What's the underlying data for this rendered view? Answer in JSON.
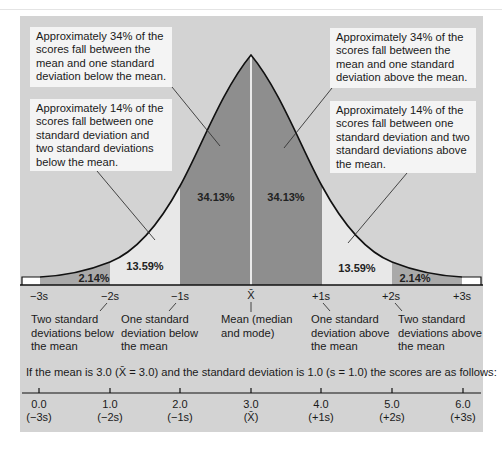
{
  "notes": {
    "left_34": "Approximately 34% of the scores fall between the mean and one standard deviation below the mean.",
    "right_34": "Approximately 34% of the scores fall between the mean and one standard deviation above the mean.",
    "left_14": "Approximately 14% of the scores fall between one standard deviation and two standard deviations below the mean.",
    "right_14": "Approximately 14% of the scores fall between one standard deviation and two standard deviations above the mean."
  },
  "regions": {
    "left_2": "2.14%",
    "left_14": "13.59%",
    "left_34": "34.13%",
    "right_34": "34.13%",
    "right_14": "13.59%",
    "right_2": "2.14%"
  },
  "axis_labels": [
    "−3s",
    "−2s",
    "−1s",
    "X̄",
    "+1s",
    "+2s",
    "+3s"
  ],
  "descriptions": {
    "minus2": "Two standard deviations below the mean",
    "minus1": "One standard deviation below the mean",
    "mean": "Mean (median and mode)",
    "plus1": "One standard deviation above the mean",
    "plus2": "Two standard deviations above the mean"
  },
  "caption": "If the mean is 3.0 (X̄ = 3.0) and the standard deviation is 1.0 (s = 1.0) the scores are as follows:",
  "scale": [
    {
      "value": "0.0",
      "sd": "(−3s)"
    },
    {
      "value": "1.0",
      "sd": "(−2s)"
    },
    {
      "value": "2.0",
      "sd": "(−1s)"
    },
    {
      "value": "3.0",
      "sd": "(X̄)"
    },
    {
      "value": "4.0",
      "sd": "(+1s)"
    },
    {
      "value": "5.0",
      "sd": "(+2s)"
    },
    {
      "value": "6.0",
      "sd": "(+3s)"
    }
  ],
  "colors": {
    "panel": "#d3d3d3",
    "band_34": "#8e8e8e",
    "band_14": "#e8e8e8",
    "band_2": "#a9a9a9",
    "tail": "#ffffff"
  }
}
